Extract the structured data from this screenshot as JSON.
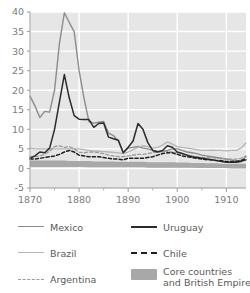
{
  "chart_data": {
    "type": "line",
    "title": "",
    "subtitle": "",
    "xlabel": "",
    "ylabel": "",
    "xlim": [
      1870,
      1914
    ],
    "ylim": [
      -5,
      40
    ],
    "xticks": [
      1870,
      1880,
      1890,
      1900,
      1910
    ],
    "xtick_labels": [
      "1870",
      "1880",
      "1890",
      "1900",
      "1910"
    ],
    "xminor_ticks": [
      1875,
      1885,
      1895,
      1905
    ],
    "yticks": [
      -5,
      0,
      5,
      10,
      15,
      20,
      25,
      30,
      35,
      40
    ],
    "ytick_labels": [
      "-5",
      "0",
      "5",
      "10",
      "15",
      "20",
      "25",
      "30",
      "35",
      "40"
    ],
    "grid": true,
    "grid_color": "#ffffff",
    "plot_background": "#e6e6e6",
    "legend_position": "below",
    "legend_columns": 2,
    "x": [
      1870,
      1871,
      1872,
      1873,
      1874,
      1875,
      1876,
      1877,
      1878,
      1879,
      1880,
      1881,
      1882,
      1883,
      1884,
      1885,
      1886,
      1887,
      1888,
      1889,
      1890,
      1891,
      1892,
      1893,
      1894,
      1895,
      1896,
      1897,
      1898,
      1899,
      1900,
      1901,
      1902,
      1903,
      1904,
      1905,
      1906,
      1907,
      1908,
      1909,
      1910,
      1911,
      1912,
      1913,
      1914
    ],
    "series": [
      {
        "name": "Mexico",
        "color": "#8c8c8c",
        "style": "solid",
        "width": 1.4,
        "values": [
          18.5,
          16.0,
          13.0,
          14.6,
          14.4,
          20.0,
          32.0,
          39.8,
          37.3,
          35.0,
          25.0,
          18.0,
          12.0,
          11.6,
          11.8,
          12.0,
          9.0,
          8.4,
          7.0,
          4.0,
          5.2,
          5.4,
          5.6,
          5.2,
          5.0,
          4.6,
          4.4,
          4.3,
          4.6,
          5.0,
          5.0,
          4.6,
          4.2,
          4.0,
          3.8,
          3.4,
          3.2,
          3.0,
          2.8,
          2.6,
          2.4,
          2.2,
          2.0,
          2.0,
          3.0
        ]
      },
      {
        "name": "Brazil",
        "color": "#b4b4b4",
        "style": "solid",
        "width": 1.3,
        "values": [
          5.2,
          5.0,
          5.0,
          5.0,
          5.0,
          5.0,
          5.0,
          5.0,
          5.0,
          5.0,
          5.0,
          4.8,
          4.6,
          4.5,
          4.4,
          4.3,
          4.2,
          4.1,
          4.0,
          3.8,
          4.2,
          4.8,
          5.4,
          5.8,
          5.6,
          5.2,
          5.4,
          6.0,
          6.8,
          6.2,
          5.6,
          5.4,
          5.2,
          5.0,
          4.8,
          4.6,
          4.6,
          4.7,
          4.6,
          4.6,
          4.5,
          4.6,
          4.6,
          5.2,
          6.5
        ]
      },
      {
        "name": "Argentina",
        "color": "#9a9a9a",
        "style": "dashed",
        "width": 1.3,
        "values": [
          3.0,
          3.0,
          3.2,
          3.6,
          4.4,
          5.6,
          5.8,
          5.4,
          5.6,
          5.0,
          4.2,
          4.0,
          4.2,
          4.2,
          4.0,
          3.8,
          3.4,
          3.2,
          3.0,
          3.0,
          3.2,
          3.4,
          3.6,
          3.6,
          3.8,
          4.0,
          4.2,
          4.4,
          4.4,
          4.2,
          4.0,
          3.8,
          3.4,
          3.2,
          3.0,
          2.8,
          2.8,
          2.8,
          2.6,
          2.6,
          2.4,
          2.4,
          2.4,
          2.6,
          3.2
        ]
      },
      {
        "name": "Uruguay",
        "color": "#2b2b2b",
        "style": "solid",
        "width": 1.5,
        "values": [
          2.6,
          3.2,
          4.2,
          4.0,
          5.2,
          10.0,
          17.0,
          24.0,
          18.0,
          13.5,
          12.6,
          12.5,
          12.5,
          10.5,
          11.5,
          11.6,
          8.0,
          7.6,
          7.2,
          4.0,
          5.4,
          7.0,
          11.5,
          10.0,
          6.6,
          4.6,
          4.2,
          4.6,
          5.8,
          5.4,
          4.2,
          3.8,
          3.4,
          3.0,
          2.8,
          2.6,
          2.4,
          2.2,
          2.0,
          1.8,
          1.6,
          1.6,
          1.6,
          1.8,
          2.2
        ]
      },
      {
        "name": "Chile",
        "color": "#1f1f1f",
        "style": "dashed",
        "width": 1.5,
        "values": [
          2.4,
          2.4,
          2.6,
          2.8,
          3.0,
          3.2,
          3.6,
          4.2,
          4.6,
          4.2,
          3.4,
          3.2,
          3.0,
          3.0,
          3.0,
          2.8,
          2.6,
          2.4,
          2.4,
          2.2,
          2.6,
          2.6,
          2.6,
          2.6,
          2.8,
          3.0,
          3.4,
          3.8,
          4.0,
          4.0,
          3.6,
          3.2,
          3.0,
          2.8,
          2.6,
          2.4,
          2.2,
          2.2,
          2.0,
          2.0,
          1.8,
          1.8,
          1.8,
          2.0,
          2.4
        ]
      }
    ],
    "band": {
      "name": "Core countries and British Empire",
      "color": "#a8a8a8",
      "upper": [
        2.0,
        2.0,
        2.0,
        2.0,
        2.0,
        2.0,
        2.0,
        2.0,
        1.9,
        1.9,
        1.9,
        1.9,
        1.9,
        1.8,
        1.8,
        1.8,
        1.8,
        1.8,
        1.7,
        1.7,
        1.7,
        1.7,
        1.7,
        1.7,
        1.6,
        1.6,
        1.6,
        1.6,
        1.6,
        1.6,
        1.5,
        1.5,
        1.5,
        1.4,
        1.4,
        1.4,
        1.3,
        1.3,
        1.3,
        1.2,
        1.2,
        1.2,
        1.2,
        1.2,
        1.2
      ],
      "lower": [
        0.4,
        0.4,
        0.4,
        0.4,
        0.4,
        0.4,
        0.4,
        0.4,
        0.4,
        0.4,
        0.4,
        0.4,
        0.3,
        0.3,
        0.3,
        0.3,
        0.3,
        0.3,
        0.3,
        0.3,
        0.3,
        0.3,
        0.3,
        0.3,
        0.2,
        0.2,
        0.2,
        0.2,
        0.2,
        0.2,
        0.2,
        0.2,
        0.2,
        0.2,
        0.1,
        0.1,
        0.1,
        0.1,
        0.1,
        0.1,
        0.1,
        0.0,
        0.0,
        0.0,
        0.0
      ]
    }
  },
  "legend": {
    "items": [
      {
        "label": "Mexico",
        "color": "#8c8c8c",
        "style": "solid",
        "width": 1.6
      },
      {
        "label": "Uruguay",
        "color": "#2b2b2b",
        "style": "solid",
        "width": 2.0
      },
      {
        "label": "Brazil",
        "color": "#b4b4b4",
        "style": "solid",
        "width": 1.6
      },
      {
        "label": "Chile",
        "color": "#1f1f1f",
        "style": "dashed",
        "width": 2.0
      },
      {
        "label": "Argentina",
        "color": "#9a9a9a",
        "style": "dashed",
        "width": 1.6
      },
      {
        "label": "Core countries\nand British Empire",
        "color": "#a8a8a8",
        "style": "block",
        "width": 0
      }
    ]
  }
}
